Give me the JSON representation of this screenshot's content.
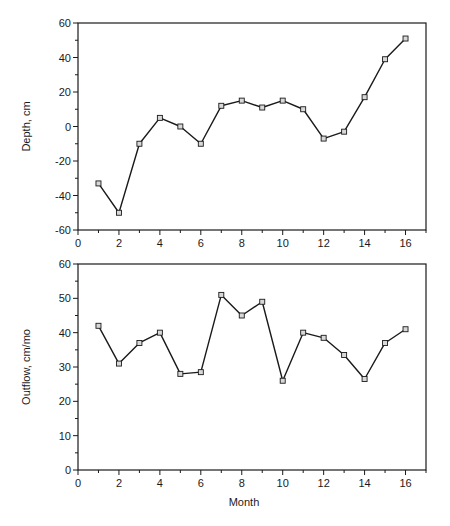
{
  "chart_data": [
    {
      "type": "line",
      "title": "",
      "xlabel": "",
      "ylabel": "Depth, cm",
      "xlim": [
        0,
        17
      ],
      "ylim": [
        -60,
        60
      ],
      "xticks": [
        0,
        2,
        4,
        6,
        8,
        10,
        12,
        14,
        16
      ],
      "yticks": [
        -60,
        -40,
        -20,
        0,
        20,
        40,
        60
      ],
      "grid": false,
      "marker": "square",
      "series": [
        {
          "name": "Depth",
          "x": [
            1,
            2,
            3,
            4,
            5,
            6,
            7,
            8,
            9,
            10,
            11,
            12,
            13,
            14,
            15,
            16
          ],
          "values": [
            -33,
            -50,
            -10,
            5,
            0,
            -10,
            12,
            15,
            11,
            15,
            10,
            -7,
            -3,
            17,
            39,
            51
          ]
        }
      ]
    },
    {
      "type": "line",
      "title": "",
      "xlabel": "Month",
      "ylabel": "Outflow, cm/mo",
      "xlim": [
        0,
        17
      ],
      "ylim": [
        0,
        60
      ],
      "xticks": [
        0,
        2,
        4,
        6,
        8,
        10,
        12,
        14,
        16
      ],
      "yticks": [
        0,
        10,
        20,
        30,
        40,
        50,
        60
      ],
      "grid": false,
      "marker": "square",
      "series": [
        {
          "name": "Outflow",
          "x": [
            1,
            2,
            3,
            4,
            5,
            6,
            7,
            8,
            9,
            10,
            11,
            12,
            13,
            14,
            15,
            16
          ],
          "values": [
            42,
            31,
            37,
            40,
            28,
            28.5,
            51,
            45,
            49,
            26,
            40,
            38.5,
            33.5,
            26.5,
            37,
            41
          ]
        }
      ]
    }
  ],
  "colors": {
    "line": "#1a1a1a",
    "marker_fill": "#d8d8d8",
    "axis": "#1a1a1a"
  }
}
